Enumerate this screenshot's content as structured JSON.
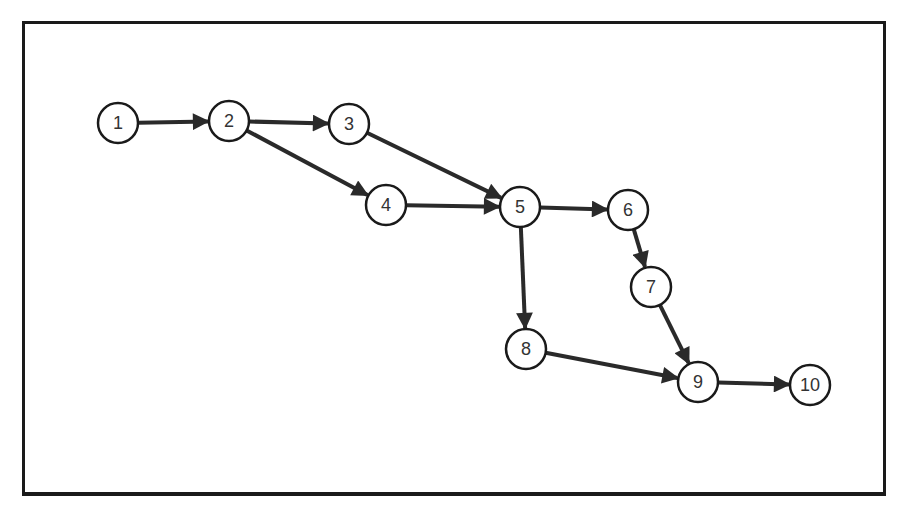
{
  "diagram": {
    "type": "directed-network",
    "nodes": [
      {
        "id": "1",
        "label": "1",
        "x": 118,
        "y": 123
      },
      {
        "id": "2",
        "label": "2",
        "x": 229,
        "y": 121
      },
      {
        "id": "3",
        "label": "3",
        "x": 349,
        "y": 124
      },
      {
        "id": "4",
        "label": "4",
        "x": 386,
        "y": 205
      },
      {
        "id": "5",
        "label": "5",
        "x": 520,
        "y": 207
      },
      {
        "id": "6",
        "label": "6",
        "x": 628,
        "y": 210
      },
      {
        "id": "7",
        "label": "7",
        "x": 651,
        "y": 287
      },
      {
        "id": "8",
        "label": "8",
        "x": 526,
        "y": 349
      },
      {
        "id": "9",
        "label": "9",
        "x": 698,
        "y": 382
      },
      {
        "id": "10",
        "label": "10",
        "x": 810,
        "y": 385
      }
    ],
    "edges": [
      {
        "from": "1",
        "to": "2"
      },
      {
        "from": "2",
        "to": "3"
      },
      {
        "from": "2",
        "to": "4"
      },
      {
        "from": "3",
        "to": "5"
      },
      {
        "from": "4",
        "to": "5"
      },
      {
        "from": "5",
        "to": "6"
      },
      {
        "from": "5",
        "to": "8"
      },
      {
        "from": "6",
        "to": "7"
      },
      {
        "from": "7",
        "to": "9"
      },
      {
        "from": "8",
        "to": "9"
      },
      {
        "from": "9",
        "to": "10"
      }
    ],
    "node_radius": 20,
    "colors": {
      "stroke": "#1a1a1a",
      "edge": "#2a2a2a",
      "label": "#333333",
      "fill": "#ffffff"
    }
  }
}
